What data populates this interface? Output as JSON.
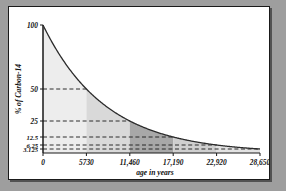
{
  "chart_data": {
    "type": "line",
    "title": "",
    "xlabel": "age in years",
    "ylabel": "% of Carbon-14",
    "xlim": [
      0,
      28650
    ],
    "ylim": [
      0,
      100
    ],
    "grid": "dashed-horizontal",
    "legend": "none",
    "half_life_years": 5730,
    "x_ticks": [
      {
        "value": 0,
        "label": "0"
      },
      {
        "value": 5730,
        "label": "5730"
      },
      {
        "value": 11460,
        "label": "11,460"
      },
      {
        "value": 17190,
        "label": "17,190"
      },
      {
        "value": 22920,
        "label": "22,920"
      },
      {
        "value": 28650,
        "label": "28,650"
      }
    ],
    "y_ticks": [
      {
        "value": 100,
        "label": "100"
      },
      {
        "value": 50,
        "label": "50"
      },
      {
        "value": 25,
        "label": "25"
      },
      {
        "value": 12.5,
        "label": "12.5"
      },
      {
        "value": 6.25,
        "label": "6.25"
      },
      {
        "value": 3.125,
        "label": "3.125"
      }
    ],
    "series": [
      {
        "name": "Carbon-14 remaining",
        "x": [
          0,
          5730,
          11460,
          17190,
          22920,
          28650
        ],
        "values": [
          100,
          50,
          25,
          12.5,
          6.25,
          3.125
        ]
      }
    ],
    "shaded_regions": [
      {
        "x_start": 0,
        "x_end": 5730,
        "y_top": 100,
        "shade": "#ededed"
      },
      {
        "x_start": 5730,
        "x_end": 11460,
        "y_top": 50,
        "shade": "#d9d9d9"
      },
      {
        "x_start": 11460,
        "x_end": 17190,
        "y_top": 25,
        "shade": "#a8a8a8"
      },
      {
        "x_start": 17190,
        "x_end": 22920,
        "y_top": 12.5,
        "shade": "#cfcfcf"
      },
      {
        "x_start": 22920,
        "x_end": 28650,
        "y_top": 6.25,
        "shade": "#e2e2e2"
      }
    ],
    "colors": {
      "curve": "#2b2b2b",
      "axis": "#1a1a1a",
      "gridline": "#1a1a1a",
      "panel_background": "#ffffff",
      "outer_background": "#9e9e9e"
    }
  }
}
